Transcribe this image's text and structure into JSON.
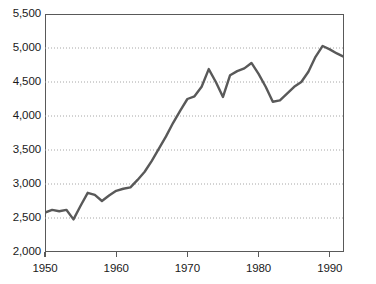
{
  "chart_data": {
    "type": "line",
    "title": "",
    "subtitle": "",
    "xlabel": "",
    "ylabel": "",
    "xlim": [
      1950,
      1992
    ],
    "ylim": [
      2000,
      5500
    ],
    "grid": "horizontal-dotted",
    "legend": "none",
    "line_color": "#595959",
    "axis_color": "#595959",
    "grid_color": "#a6a6a6",
    "text_color": "#1a1a1a",
    "y_ticks": [
      2000,
      2500,
      3000,
      3500,
      4000,
      4500,
      5000,
      5500
    ],
    "y_tick_labels": [
      "2,000",
      "2,500",
      "3,000",
      "3,500",
      "4,000",
      "4,500",
      "5,000",
      "5,500"
    ],
    "x_ticks": [
      1950,
      1960,
      1970,
      1980,
      1990
    ],
    "x_tick_labels": [
      "1950",
      "1960",
      "1970",
      "1980",
      "1990"
    ],
    "x": [
      1950,
      1951,
      1952,
      1953,
      1954,
      1955,
      1956,
      1957,
      1958,
      1959,
      1960,
      1961,
      1962,
      1963,
      1964,
      1965,
      1966,
      1967,
      1968,
      1969,
      1970,
      1971,
      1972,
      1973,
      1974,
      1975,
      1976,
      1977,
      1978,
      1979,
      1980,
      1981,
      1982,
      1983,
      1984,
      1985,
      1986,
      1987,
      1988,
      1989,
      1990,
      1991,
      1992
    ],
    "series": [
      {
        "name": "series-1",
        "values": [
          2580,
          2620,
          2600,
          2620,
          2480,
          2680,
          2870,
          2840,
          2750,
          2830,
          2900,
          2930,
          2950,
          3060,
          3180,
          3340,
          3520,
          3700,
          3900,
          4080,
          4250,
          4290,
          4430,
          4690,
          4500,
          4280,
          4600,
          4660,
          4700,
          4780,
          4620,
          4430,
          4210,
          4230,
          4330,
          4430,
          4500,
          4650,
          4870,
          5030,
          4980,
          4920,
          4870
        ]
      }
    ]
  }
}
